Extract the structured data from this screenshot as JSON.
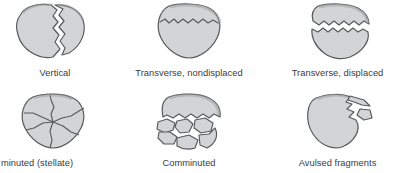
{
  "figure": {
    "background_color": "#ffffff",
    "bone_fill_color": "#d2d4d6",
    "bone_outline_color": "#58595b",
    "caption_color": "#3a3a3c",
    "gap_color": "#ffffff"
  },
  "panels": [
    {
      "id": "vertical",
      "label": "Vertical",
      "row": 1,
      "column": 1,
      "fragment_count": 2,
      "description": "Single vertical jagged fracture line splitting a narrow lateral fragment from the main patella body"
    },
    {
      "id": "transverse-nondisplaced",
      "label": "Transverse, nondisplaced",
      "row": 1,
      "column": 2,
      "fragment_count": 2,
      "description": "Horizontal zigzag fracture across the upper third with no separation between fragments"
    },
    {
      "id": "transverse-displaced",
      "label": "Transverse, displaced",
      "row": 1,
      "column": 3,
      "fragment_count": 2,
      "description": "Horizontal fracture across the upper third with a visible white gap separating the superior pole from the body"
    },
    {
      "id": "comminuted-stellate",
      "label": "minuted (stellate)",
      "label_full": "Comminuted (stellate)",
      "clipped_left": true,
      "row": 2,
      "column": 1,
      "fragment_count": 5,
      "description": "Star-shaped fracture lines radiating outward from a central point into wedge-shaped segments"
    },
    {
      "id": "comminuted",
      "label": "Comminuted",
      "row": 2,
      "column": 2,
      "fragment_count": 7,
      "description": "Intact superior cap above numerous irregular separated bone fragments"
    },
    {
      "id": "avulsed-fragments",
      "label": "Avulsed fragments",
      "row": 2,
      "column": 3,
      "fragment_count": 3,
      "description": "Main patella body with two small bone fragments pulled away from the superolateral margin"
    }
  ]
}
